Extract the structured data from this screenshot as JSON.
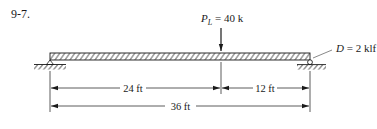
{
  "problem_label": "9-7.",
  "load": {
    "symbol": "P",
    "subscript": "L",
    "equals": " = ",
    "value": "40 k",
    "position_ft": 24
  },
  "distributed_load": {
    "symbol": "D",
    "equals": " = ",
    "value": "2 klf"
  },
  "dimensions": {
    "left_segment": "24 ft",
    "right_segment": "12 ft",
    "total_span": "36 ft"
  },
  "supports": {
    "left": "pin",
    "right": "roller"
  },
  "colors": {
    "line": "#1a1a1a",
    "dim_line": "#333333"
  }
}
